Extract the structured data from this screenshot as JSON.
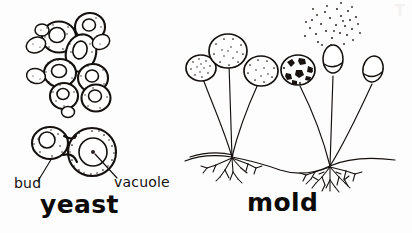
{
  "figure": {
    "style": "black ink line drawing on white paper",
    "width": 412,
    "height": 233,
    "background_color": "#fdfdfd",
    "ink_color": "#14100e"
  },
  "labels": {
    "bud": "bud",
    "vacuole": "vacuole",
    "yeast": "yeast",
    "mold": "mold"
  },
  "bleed_through": {
    "top_right": "T"
  },
  "panels": [
    {
      "id": "yeast-panel",
      "caption": "yeast",
      "description": "Budding yeast cells, a cluster above and one labeled pair below",
      "annotations": [
        "bud",
        "vacuole"
      ]
    },
    {
      "id": "mold-panel",
      "caption": "mold",
      "description": "Mold colony with sporangiophores, sporangia, spores, stolon and rhizoids"
    }
  ],
  "yeast_panel": {
    "cluster": {
      "cell_count": 9,
      "note": "chain of ovoid budding cells with stippled cytoplasm and clear vacuoles"
    },
    "labeled_pair": {
      "bud_cell": {
        "label": "bud",
        "position": "left, smaller"
      },
      "mother_cell": {
        "label": "vacuole",
        "position": "right, larger, contains round vacuole with central dot"
      }
    }
  },
  "mold_panel": {
    "nodes": 2,
    "sporangiophores": 6,
    "structures": [
      {
        "name": "sporangium-1",
        "state": "intact-stippled",
        "size": "small"
      },
      {
        "name": "sporangium-2",
        "state": "intact-stippled",
        "size": "large"
      },
      {
        "name": "sporangium-3",
        "state": "intact-stippled",
        "size": "medium"
      },
      {
        "name": "sporangium-4",
        "state": "dark-rupturing",
        "size": "medium"
      },
      {
        "name": "columella-5",
        "state": "open-releasing-spores",
        "size": "small"
      },
      {
        "name": "columella-6",
        "state": "empty",
        "size": "small"
      }
    ],
    "spores_released": 34,
    "ground": {
      "stolon": "horizontal hypha connecting nodes",
      "rhizoids": "root-like branching at each node"
    }
  }
}
